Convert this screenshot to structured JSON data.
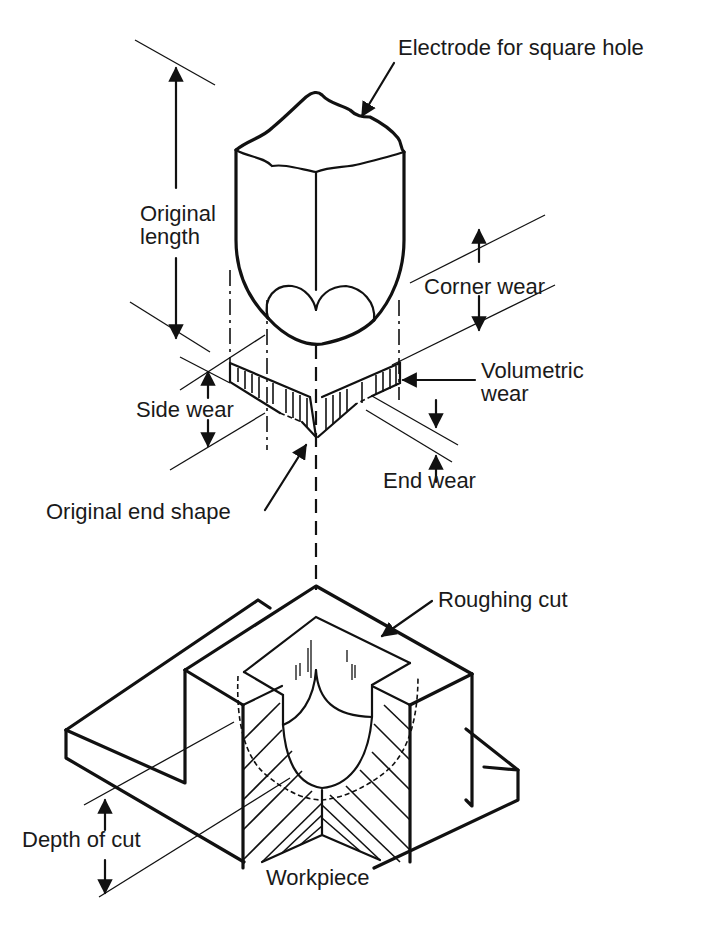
{
  "figure": {
    "type": "isometric technical diagram"
  },
  "labels": {
    "electrode": "Electrode for square hole",
    "original_length_line1": "Original",
    "original_length_line2": "length",
    "corner_wear": "Corner wear",
    "volumetric_wear_line1": "Volumetric",
    "volumetric_wear_line2": "wear",
    "side_wear": "Side wear",
    "end_wear": "End wear",
    "original_end_shape": "Original end shape",
    "roughing_cut": "Roughing cut",
    "depth_of_cut": "Depth of cut",
    "workpiece": "Workpiece"
  },
  "colors": {
    "ink": "#111111",
    "background": "#ffffff"
  }
}
